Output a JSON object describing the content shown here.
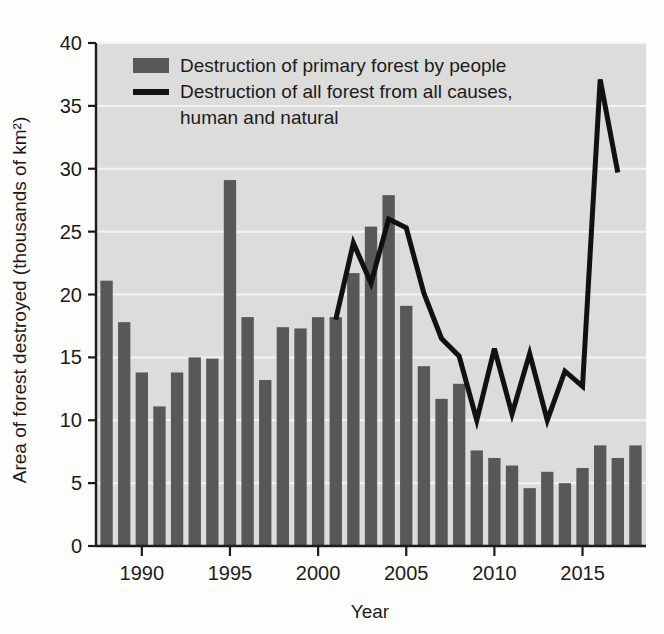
{
  "chart_data": {
    "type": "bar",
    "title": "",
    "xlabel": "Year",
    "ylabel": "Area of forest destroyed (thousands of km²)",
    "ylim": [
      0,
      40
    ],
    "xlim": [
      1987.4,
      2018.6
    ],
    "y_ticks": [
      0,
      5,
      10,
      15,
      20,
      25,
      30,
      35,
      40
    ],
    "y_tick_labels": [
      "0",
      "5",
      "10",
      "15",
      "20",
      "25",
      "30",
      "35",
      "40"
    ],
    "x_ticks": [
      1990,
      1995,
      2000,
      2005,
      2010,
      2015
    ],
    "x_tick_labels": [
      "1990",
      "1995",
      "2000",
      "2005",
      "2010",
      "2015"
    ],
    "grid": "horizontal white gridlines on gray plot background",
    "legend_position": "upper-left inside plot",
    "categories": [
      1988,
      1989,
      1990,
      1991,
      1992,
      1993,
      1994,
      1995,
      1996,
      1997,
      1998,
      1999,
      2000,
      2001,
      2002,
      2003,
      2004,
      2005,
      2006,
      2007,
      2008,
      2009,
      2010,
      2011,
      2012,
      2013,
      2014,
      2015,
      2016,
      2017,
      2018
    ],
    "series": [
      {
        "name": "Destruction of primary forest by people",
        "type": "bar",
        "color": "#58585a",
        "values": [
          21.1,
          17.8,
          13.8,
          11.1,
          13.8,
          15.0,
          14.9,
          29.1,
          18.2,
          13.2,
          17.4,
          17.3,
          18.2,
          18.2,
          21.7,
          25.4,
          27.9,
          19.1,
          14.3,
          11.7,
          12.9,
          7.6,
          7.0,
          6.4,
          4.6,
          5.9,
          5.0,
          6.2,
          8.0,
          7.0,
          8.0
        ]
      },
      {
        "name": "Destruction of all forest from all causes, human and natural",
        "type": "line",
        "color": "#111111",
        "x": [
          2001,
          2002,
          2003,
          2004,
          2005,
          2006,
          2007,
          2008,
          2009,
          2010,
          2011,
          2012,
          2013,
          2014,
          2015,
          2016,
          2017
        ],
        "values": [
          18.0,
          24.1,
          20.9,
          26.0,
          25.3,
          20.1,
          16.5,
          15.1,
          10.0,
          15.7,
          10.5,
          15.3,
          10.0,
          13.9,
          12.7,
          37.1,
          29.7
        ]
      }
    ],
    "legend": [
      {
        "label": "Destruction of primary forest by people",
        "marker": "bar-swatch",
        "color": "#58585a"
      },
      {
        "label": "Destruction of all forest from all causes,",
        "label_line_2": "human and natural",
        "marker": "line-swatch",
        "color": "#111111"
      }
    ]
  },
  "figure": {
    "background_color": "#fdfdfc",
    "plot_background_color": "#dcdcda",
    "gridline_color": "#f4f4f2",
    "axis_color": "#1b1b1b"
  }
}
